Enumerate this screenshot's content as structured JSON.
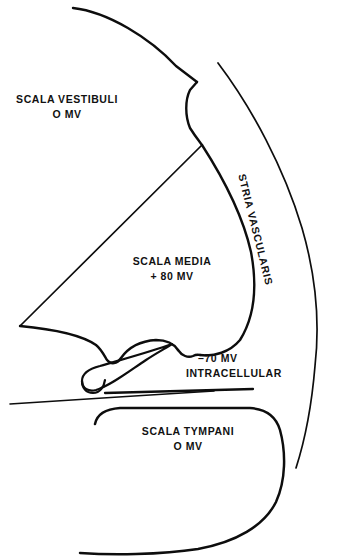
{
  "figure": {
    "background_color": "#ffffff",
    "line_color": "#0d0d0d"
  },
  "labels": {
    "scala_vestibuli": {
      "name": "SCALA VESTIBULI",
      "potential": "O MV"
    },
    "scala_media": {
      "name": "SCALA MEDIA",
      "potential": "+ 80 MV"
    },
    "intracellular": {
      "potential": "–70 MV",
      "name": "INTRACELLULAR"
    },
    "scala_tympani": {
      "name": "SCALA TYMPANI",
      "potential": "O MV"
    },
    "stria_vascularis": {
      "name": "STRIA VASCULARIS"
    }
  }
}
